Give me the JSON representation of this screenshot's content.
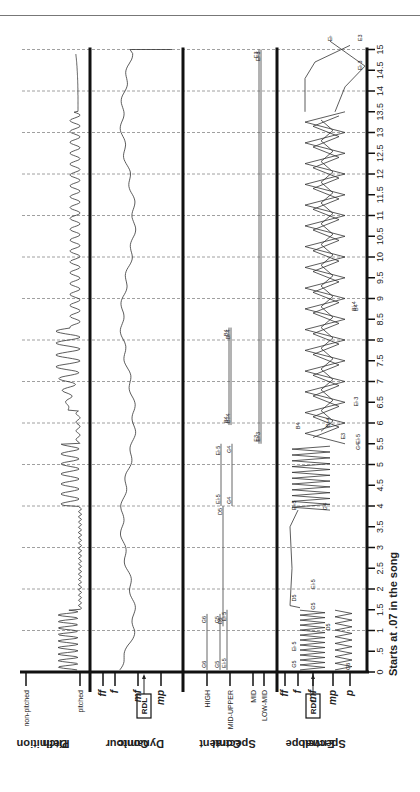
{
  "chart_data": {
    "type": "line",
    "orientation": "rotated 90deg clockwise (time axis vertical, increasing upward)",
    "x_axis": {
      "label": "Starts at .07 in the song",
      "ticks": [
        "0",
        ".5",
        "1",
        "1.5",
        "2",
        "2.5",
        "3",
        "3.5",
        "4",
        "4.5",
        "5",
        "5.5",
        "6",
        "6.5",
        "7",
        "7.5",
        "8",
        "8.5",
        "9",
        "9.5",
        "10",
        "10.5",
        "11",
        "11.5",
        "12",
        "12.5",
        "13",
        "13.5",
        "14",
        "14.5",
        "15"
      ],
      "range": [
        0,
        15
      ],
      "grid": "dashed lines at every whole second"
    },
    "panels": [
      {
        "name": "Pitch Definition",
        "title_lines": [
          "Pitch",
          "Definition"
        ],
        "scale": [
          "non-pitched",
          "pitched"
        ],
        "description": "Contour mostly near 'pitched'; strong oscillations between ~0.1-1.5s, ~4-5.5s and ~6.5-8.3s; smaller wobbles later; rises to non-pitched near 15s"
      },
      {
        "name": "Dynamic Contour",
        "title_lines": [
          "Dynamic",
          "Contour"
        ],
        "scale": [
          "ff",
          "f",
          "mf",
          "mp"
        ],
        "rdl_label": "RDL",
        "rdl_level": "mf",
        "description": "Fluctuates around f/mf through the excerpt, ending with a flat line near mp at 15s"
      },
      {
        "name": "Spectral Content",
        "title_lines": [
          "Spectral",
          "Content"
        ],
        "scale": [
          "HIGH",
          "MID-UPPER",
          "MID",
          "LOW-MID"
        ],
        "segments": [
          {
            "note": "G6",
            "band": "HIGH",
            "start": 0.05,
            "end": 1.4
          },
          {
            "note": "G5",
            "band": "MID-UPPER",
            "start": 0.05,
            "end": 1.4
          },
          {
            "note": "E♭5",
            "band": "MID-UPPER",
            "start": 0.05,
            "end": 1.5
          },
          {
            "note": "D5",
            "band": "MID-UPPER",
            "start": 1.1,
            "end": 4.0
          },
          {
            "note": "E♭5",
            "band": "MID-UPPER",
            "start": 4.0,
            "end": 5.5
          },
          {
            "note": "G4",
            "band": "MID-UPPER",
            "start": 4.0,
            "end": 5.5
          },
          {
            "note": "B4",
            "band": "MID-UPPER",
            "start": 5.95,
            "end": 8.3
          },
          {
            "note": "B♭4",
            "band": "MID-UPPER",
            "start": 5.95,
            "end": 8.3
          },
          {
            "note": "E3",
            "band": "LOW-MID",
            "start": 5.5,
            "end": 15.0
          },
          {
            "note": "E♭3",
            "band": "LOW-MID",
            "start": 5.5,
            "end": 15.0
          }
        ]
      },
      {
        "name": "Spectral Envelope",
        "title_lines": [
          "Spectral",
          "Envelope"
        ],
        "scale": [
          "ff",
          "f",
          "mf",
          "mp",
          "p"
        ],
        "rdl_label": "RDL",
        "rdl_level": "mf",
        "annotations": [
          "G5",
          "E♭5",
          "G6",
          "D5",
          "G5",
          "E♭5",
          "D5",
          "E♭5",
          "G4",
          "G4",
          "E♭5",
          "B4",
          "B♭4",
          "E3",
          "E♭3",
          "B♭4",
          "B4",
          "E♭",
          "E3",
          "E♭3"
        ],
        "description": "Zig-zag envelopes crossing between mf and p (0-1.5s), D5 line near ff 1.5-4s, dense oscillation 4-5.5s, overlapping zig-zags 5.5-13.5s, descending lines to E3/E♭3 at 14.5-15s"
      }
    ]
  },
  "labels": {
    "pitch_title_1": "Pitch",
    "pitch_title_2": "Definition",
    "dyn_title_1": "Dynamic",
    "dyn_title_2": "Contour",
    "sc_title_1": "Spectral",
    "sc_title_2": "Content",
    "se_title_1": "Spectral",
    "se_title_2": "Envelope",
    "non_pitched": "non-pitched",
    "pitched": "pitched",
    "ff": "ff",
    "f": "f",
    "mf": "mf",
    "mp": "mp",
    "p": "p",
    "rdl": "RDL",
    "high": "HIGH",
    "mid_upper": "MID-UPPER",
    "mid": "MID",
    "low_mid": "LOW-MID",
    "x_caption": "Starts at .07 in the song"
  }
}
